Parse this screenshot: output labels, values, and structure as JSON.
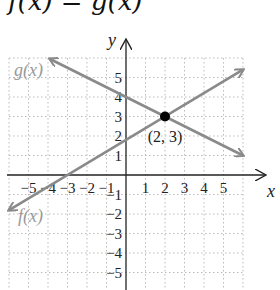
{
  "title": "f(x) = g(x)",
  "chart_data": {
    "type": "line",
    "title": "f(x) = g(x)",
    "xlabel": "x",
    "ylabel": "y",
    "xlim": [
      -6,
      6
    ],
    "ylim": [
      -6,
      6
    ],
    "grid": true,
    "x_ticks": [
      -5,
      -4,
      -3,
      -2,
      -1,
      1,
      2,
      3,
      4,
      5
    ],
    "y_ticks": [
      -5,
      -4,
      -3,
      -2,
      -1,
      1,
      2,
      3,
      4,
      5
    ],
    "series": [
      {
        "name": "f(x)",
        "slope": 0.6,
        "intercept": 1.8,
        "points": [
          [
            -3,
            0
          ],
          [
            2,
            3
          ]
        ],
        "color": "#8a8a8a"
      },
      {
        "name": "g(x)",
        "slope": -0.5,
        "intercept": 4,
        "points": [
          [
            0,
            4
          ],
          [
            2,
            3
          ]
        ],
        "color": "#8a8a8a"
      }
    ],
    "annotations": [
      {
        "text": "(2, 3)",
        "x": 2,
        "y": 3,
        "type": "intersection-point"
      }
    ]
  },
  "labels": {
    "x_axis": "x",
    "y_axis": "y",
    "f": "f(x)",
    "g": "g(x)",
    "point": "(2, 3)"
  }
}
